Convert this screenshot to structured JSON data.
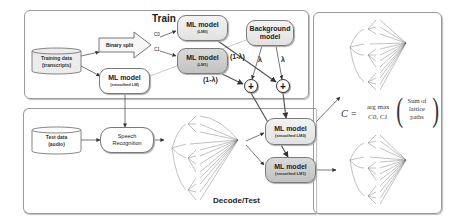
{
  "train": {
    "title": "Train",
    "training_data": {
      "line1": "Training data",
      "line2": "(transcripts)"
    },
    "binary_split": "Binary split",
    "c0_label": "C0",
    "c1_label": "C1",
    "lm0": {
      "line1": "ML model",
      "line2": "(LM0)"
    },
    "lm1": {
      "line1": "ML model",
      "line2": "(LM1)"
    },
    "smoothed_lm": {
      "line1": "ML model",
      "line2": "(smoothed LM)"
    },
    "background": {
      "line1": "Background",
      "line2": "model"
    },
    "weight_one_minus_lambda": "(1-λ)",
    "weight_lambda": "λ",
    "plus_symbol": "+"
  },
  "decode": {
    "title": "Decode/Test",
    "test_data": {
      "line1": "Test data",
      "line2": "(audio)"
    },
    "speech_recognition": {
      "line1": "Speech",
      "line2": "Recognition"
    },
    "smoothed_lm0": {
      "line1": "ML model",
      "line2": "(smoothed LM0)"
    },
    "smoothed_lm1": {
      "line1": "ML model",
      "line2": "(smoothed LM1)"
    }
  },
  "formula": {
    "lhs": "C =",
    "operator": "arg max",
    "subscript": "C0, C1",
    "arg_line1": "Sum of",
    "arg_line2": "lattice",
    "arg_line3": "paths"
  },
  "lattice": {
    "start_label": "<s>",
    "end_label": "</s>",
    "groups": [
      {
        "head": "w1",
        "leaves": [
          "w4",
          "w5",
          "w6"
        ]
      },
      {
        "head": "w2",
        "leaves": []
      },
      {
        "head": "w3",
        "leaves": [
          "w4",
          "w5",
          "w6",
          "w7"
        ]
      },
      {
        "head": "w8",
        "leaves": [
          "w7",
          "w6",
          "w5",
          "w9"
        ]
      }
    ]
  },
  "colors": {
    "frame": "#9a9a9a",
    "line": "#555555",
    "box_light": "#e8e8e8",
    "box_dark": "#c8c8c8"
  }
}
